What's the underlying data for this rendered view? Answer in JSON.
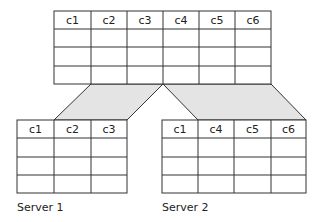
{
  "top_table": {
    "columns": [
      "c1",
      "c2",
      "c3",
      "c4",
      "c5",
      "c6"
    ],
    "empty_rows": 3
  },
  "server1": {
    "label": "Server 1",
    "columns": [
      "c1",
      "c2",
      "c3"
    ],
    "empty_rows": 3
  },
  "server2": {
    "label": "Server 2",
    "columns": [
      "c1",
      "c4",
      "c5",
      "c6"
    ],
    "empty_rows": 3
  },
  "colors": {
    "line": "#333333",
    "shade": "#e4e4e4"
  }
}
